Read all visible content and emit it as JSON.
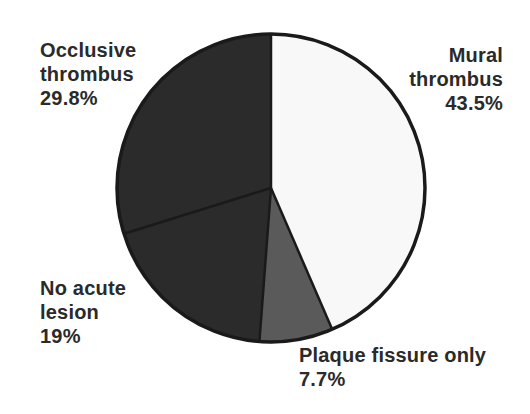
{
  "chart_data": {
    "type": "pie",
    "title": "",
    "start_angle_deg": 0,
    "direction": "clockwise",
    "slices": [
      {
        "label": "Mural thrombus",
        "value": 43.5,
        "display": "43.5%",
        "color": "#f8f8f8"
      },
      {
        "label": "Plaque fissure only",
        "value": 7.7,
        "display": "7.7%",
        "color": "#5a5a5a"
      },
      {
        "label": "No acute lesion",
        "value": 19,
        "display": "19%",
        "color": "#2b2b2b"
      },
      {
        "label": "Occlusive thrombus",
        "value": 29.8,
        "display": "29.8%",
        "color": "#2b2b2b"
      }
    ],
    "outline_color": "#1a1a1a",
    "legend": "none (direct labels)"
  },
  "labels": {
    "occlusive": {
      "line1": "Occlusive",
      "line2": "thrombus",
      "line3": "29.8%"
    },
    "mural": {
      "line1": "Mural",
      "line2": "thrombus",
      "line3": "43.5%"
    },
    "noacute": {
      "line1": "No acute",
      "line2": "lesion",
      "line3": "19%"
    },
    "plaque": {
      "line1": "Plaque fissure only",
      "line2": "7.7%"
    }
  }
}
